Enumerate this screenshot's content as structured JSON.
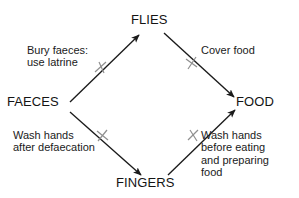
{
  "diagram": {
    "stroke_color": "#1a1a1a",
    "barrier_color": "#8c8c8c",
    "background_color": "#ffffff",
    "nodes": [
      {
        "id": "faeces",
        "label": "FAECES"
      },
      {
        "id": "flies",
        "label": "FLIES"
      },
      {
        "id": "fingers",
        "label": "FINGERS"
      },
      {
        "id": "food",
        "label": "FOOD"
      }
    ],
    "edges": [
      {
        "id": "faeces-flies",
        "from": "FAECES",
        "to": "FLIES",
        "barrier": "x-mark",
        "label_lines": [
          "Bury faeces:",
          "use latrine"
        ]
      },
      {
        "id": "flies-food",
        "from": "FLIES",
        "to": "FOOD",
        "barrier": "x-mark",
        "label_lines": [
          "Cover food"
        ]
      },
      {
        "id": "faeces-fingers",
        "from": "FAECES",
        "to": "FINGERS",
        "barrier": "x-mark",
        "label_lines": [
          "Wash hands",
          "after defaecation"
        ]
      },
      {
        "id": "fingers-food",
        "from": "FINGERS",
        "to": "FOOD",
        "barrier": "x-mark",
        "label_lines": [
          "Wash hands",
          "before eating",
          "and preparing",
          "food"
        ]
      }
    ]
  }
}
